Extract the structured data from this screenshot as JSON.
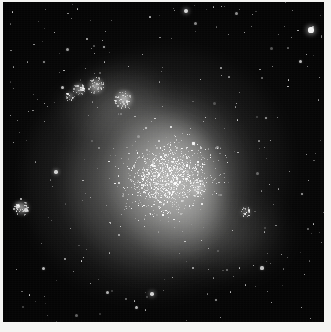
{
  "image": {
    "kind": "astronomical-photograph",
    "subject": "irregular dwarf galaxy resolved into stars",
    "medium": "grayscale photographic plate",
    "caption": "",
    "width_px": 331,
    "height_px": 332
  },
  "frame": {
    "border_color": "#f4f4f2",
    "sky_color": "#040404",
    "border_top_px": 2,
    "border_left_px": 3,
    "border_right_px": 7,
    "border_bottom_px": 10
  },
  "field": {
    "x": 3,
    "y": 2,
    "width": 321,
    "height": 320,
    "background_hex": "#040404"
  },
  "galaxy": {
    "name_shown": "",
    "morphology": "irregular / Magellanic-type",
    "center_x": 168,
    "center_y": 178,
    "extent_x_px": 250,
    "extent_y_px": 240,
    "position_angle_deg": -22,
    "glow_hex": "#b4b4b1",
    "components": [
      {
        "id": "halo-outer",
        "x": 18,
        "y": 48,
        "w": 270,
        "h": 248,
        "rot": -22,
        "peak_alpha": 0.34
      },
      {
        "id": "halo-mid",
        "x": 62,
        "y": 88,
        "w": 186,
        "h": 186,
        "rot": -28,
        "peak_alpha": 0.4
      },
      {
        "id": "halo-bar",
        "x": 110,
        "y": 108,
        "w": 112,
        "h": 150,
        "rot": -16,
        "peak_alpha": 0.46
      },
      {
        "id": "halo-core",
        "x": 142,
        "y": 128,
        "w": 74,
        "h": 104,
        "rot": -12,
        "peak_alpha": 0.4
      },
      {
        "id": "halo-nw",
        "x": 58,
        "y": 66,
        "w": 104,
        "h": 70,
        "rot": -18,
        "peak_alpha": 0.3
      },
      {
        "id": "halo-se",
        "x": 178,
        "y": 196,
        "w": 108,
        "h": 80,
        "rot": -8,
        "peak_alpha": 0.24
      }
    ]
  },
  "knots": [
    {
      "name": "hii-knot-nw-1",
      "x": 79,
      "y": 89,
      "r": 7,
      "brightness": 0.62
    },
    {
      "name": "hii-knot-nw-2",
      "x": 96,
      "y": 86,
      "r": 9,
      "brightness": 0.74
    },
    {
      "name": "hii-knot-nw-3",
      "x": 124,
      "y": 99,
      "r": 10,
      "brightness": 0.78
    },
    {
      "name": "hii-knot-nw-4",
      "x": 70,
      "y": 96,
      "r": 5,
      "brightness": 0.48
    },
    {
      "name": "hii-knot-inner",
      "x": 198,
      "y": 188,
      "r": 9,
      "brightness": 0.4
    },
    {
      "name": "hii-knot-se",
      "x": 246,
      "y": 212,
      "r": 6,
      "brightness": 0.32
    },
    {
      "name": "star-cluster-sw",
      "x": 22,
      "y": 208,
      "r": 8,
      "brightness": 0.7
    }
  ],
  "bright_stars": [
    {
      "name": "field-star-ne-bright",
      "x": 311,
      "y": 30,
      "r": 2.6,
      "mag": 0.95
    },
    {
      "name": "field-star-n",
      "x": 186,
      "y": 11,
      "r": 1.9,
      "mag": 0.85
    },
    {
      "name": "field-star-nw",
      "x": 104,
      "y": 47,
      "r": 1.4,
      "mag": 0.7
    },
    {
      "name": "field-star-w",
      "x": 62,
      "y": 87,
      "r": 1.5,
      "mag": 0.72
    },
    {
      "name": "field-star-wmid",
      "x": 56,
      "y": 172,
      "r": 1.7,
      "mag": 0.8
    },
    {
      "name": "field-star-sw-cluster-a",
      "x": 18,
      "y": 206,
      "r": 1.8,
      "mag": 0.82
    },
    {
      "name": "field-star-sw-cluster-b",
      "x": 26,
      "y": 210,
      "r": 1.6,
      "mag": 0.76
    },
    {
      "name": "field-star-s",
      "x": 152,
      "y": 294,
      "r": 1.8,
      "mag": 0.82
    },
    {
      "name": "field-star-s2",
      "x": 136,
      "y": 307,
      "r": 1.5,
      "mag": 0.7
    },
    {
      "name": "field-star-se",
      "x": 262,
      "y": 268,
      "r": 1.6,
      "mag": 0.74
    },
    {
      "name": "field-star-e",
      "x": 302,
      "y": 194,
      "r": 1.4,
      "mag": 0.66
    },
    {
      "name": "field-star-ne2",
      "x": 266,
      "y": 118,
      "r": 1.3,
      "mag": 0.62
    },
    {
      "name": "field-star-core",
      "x": 146,
      "y": 128,
      "r": 1.4,
      "mag": 0.68
    },
    {
      "name": "field-star-nnw",
      "x": 44,
      "y": 62,
      "r": 1.2,
      "mag": 0.58
    },
    {
      "name": "field-star-sse",
      "x": 216,
      "y": 300,
      "r": 1.3,
      "mag": 0.6
    }
  ],
  "starfield": {
    "sparse_field_count": 260,
    "resolved_galaxy_count": 2600,
    "star_color_hex": "#ffffff"
  }
}
